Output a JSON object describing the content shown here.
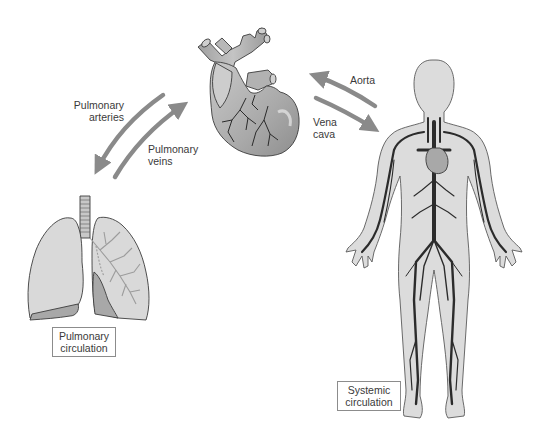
{
  "diagram": {
    "colors": {
      "arrow": "#8a8a8a",
      "organ_fill": "#d6d6d6",
      "organ_dark": "#9a9a9a",
      "vessel": "#2e2e2e",
      "outline": "#4a4a4a",
      "label_text": "#3a3a3a",
      "box_border": "#8c8c8c"
    },
    "labels": {
      "pulmonary_arteries": [
        "Pulmonary",
        "arteries"
      ],
      "pulmonary_veins": [
        "Pulmonary",
        "veins"
      ],
      "aorta": "Aorta",
      "vena_cava": [
        "Vena",
        "cava"
      ]
    },
    "boxes": {
      "pulmonary_circulation": [
        "Pulmonary",
        "circulation"
      ],
      "systemic_circulation": [
        "Systemic",
        "circulation"
      ]
    },
    "figures": {
      "heart": "heart-illustration",
      "lungs": "lungs-illustration",
      "body": "human-body-vascular-illustration"
    },
    "arrows": [
      {
        "name": "pulmonary-arteries-arrow",
        "from": "heart",
        "to": "lungs"
      },
      {
        "name": "pulmonary-veins-arrow",
        "from": "lungs",
        "to": "heart"
      },
      {
        "name": "aorta-arrow",
        "from": "heart",
        "to": "body"
      },
      {
        "name": "vena-cava-arrow",
        "from": "body",
        "to": "heart"
      }
    ]
  }
}
